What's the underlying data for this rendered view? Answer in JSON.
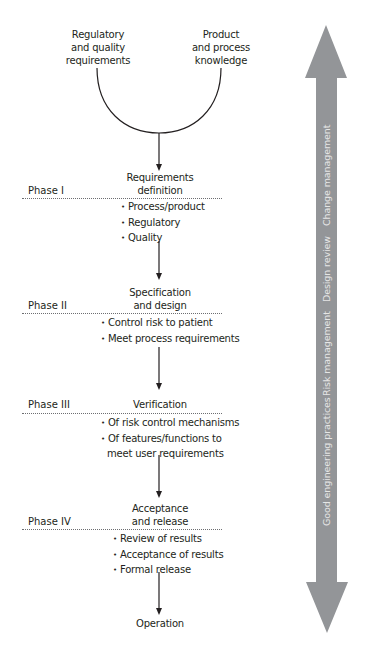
{
  "inputs": {
    "left": [
      "Regulatory",
      "and quality",
      "requirements"
    ],
    "right": [
      "Product",
      "and process",
      "knowledge"
    ]
  },
  "phases": [
    {
      "label": "Phase I",
      "title": [
        "Requirements",
        "definition"
      ],
      "bullets": [
        "Process/product",
        "Regulatory",
        "Quality"
      ]
    },
    {
      "label": "Phase II",
      "title": [
        "Specification",
        "and design"
      ],
      "bullets": [
        "Control risk to  patient",
        "Meet process requirements"
      ]
    },
    {
      "label": "Phase III",
      "title": [
        "Verification"
      ],
      "bullets": [
        "Of risk control  mechanisms",
        "Of features/functions to",
        "meet  user requirements"
      ]
    },
    {
      "label": "Phase IV",
      "title": [
        "Acceptance",
        "and release"
      ],
      "bullets": [
        "Review of results",
        "Acceptance of results",
        "Formal release"
      ]
    }
  ],
  "final_step": "Operation",
  "side_arrow": {
    "color": "#939598",
    "text_color": "#e6e6e6",
    "labels": [
      "Good engineering practices",
      "Risk management",
      "Design review",
      "Change management"
    ]
  }
}
